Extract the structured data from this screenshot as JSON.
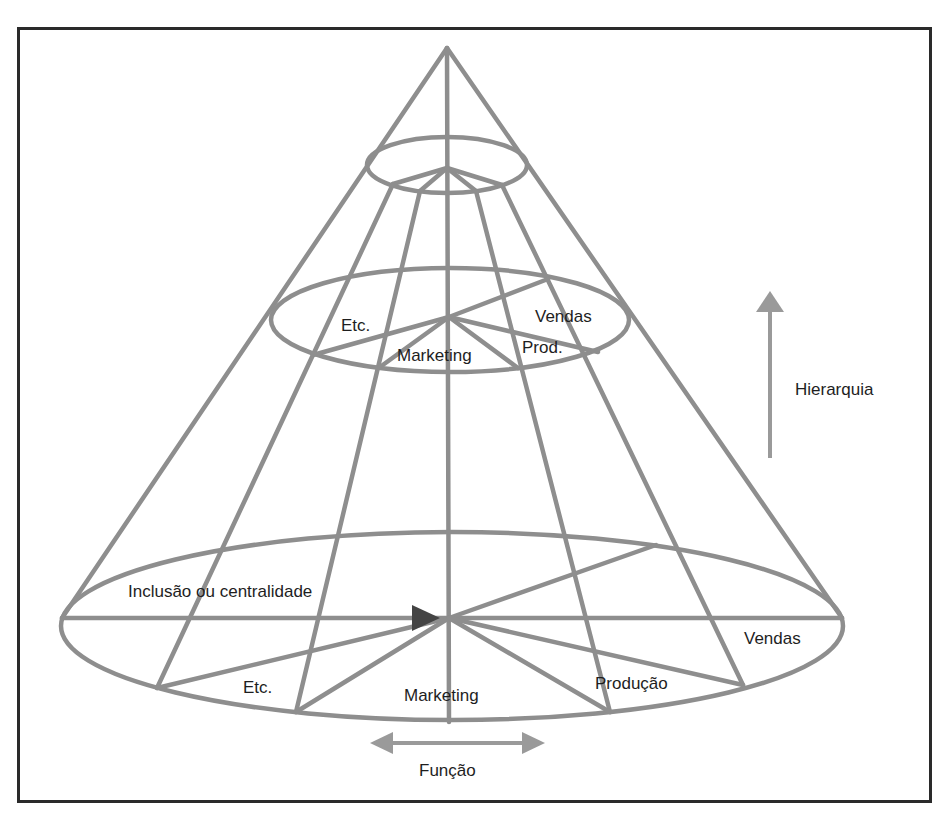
{
  "diagram": {
    "type": "cone-organization-model",
    "colors": {
      "lines": "#8e8e8e",
      "arrowhead": "#444444",
      "frame": "#2a2a2a",
      "text": "#1e1e1e"
    },
    "levels": [
      {
        "name": "top",
        "labels": []
      },
      {
        "name": "middle",
        "labels": [
          "Etc.",
          "Vendas",
          "Marketing",
          "Prod."
        ]
      },
      {
        "name": "base",
        "labels": [
          "Inclusão ou centralidade",
          "Etc.",
          "Marketing",
          "Produção",
          "Vendas"
        ]
      }
    ],
    "labels": {
      "middle_etc": "Etc.",
      "middle_vendas": "Vendas",
      "middle_marketing": "Marketing",
      "middle_prod": "Prod.",
      "base_inclusao": "Inclusão ou centralidade",
      "base_etc": "Etc.",
      "base_marketing": "Marketing",
      "base_producao": "Produção",
      "base_vendas": "Vendas",
      "axis_hierarquia": "Hierarquia",
      "axis_funcao": "Função"
    },
    "axes": [
      {
        "label": "Hierarquia",
        "direction": "up",
        "icon": "arrow-up-icon"
      },
      {
        "label": "Função",
        "direction": "left-right",
        "icon": "double-arrow-horizontal-icon"
      },
      {
        "label": "Inclusão ou centralidade",
        "direction": "toward-center",
        "icon": "arrowhead-right-icon"
      }
    ]
  }
}
